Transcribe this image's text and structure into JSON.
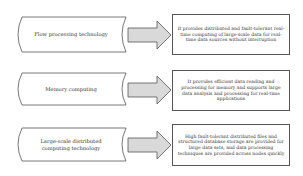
{
  "diagram": {
    "rows": [
      {
        "technology": "Flow processing technology",
        "description": "It provides distributed and fault-tolerant real-time computing of large-scale data for real-time data sources without interruption"
      },
      {
        "technology": "Memory computing",
        "description": "It provides efficient data reading and processing for memory and supports large data analysis and processing for real-time applications"
      },
      {
        "technology": "Large-scale distributed computing technology",
        "description": "High fault-tolerant distributed files and structured database storage are provided for large data sets, and data processing techniques are provided across nodes quickly"
      }
    ],
    "colors": {
      "outline": "#555555",
      "arrow_fill": "#d9d9d9",
      "background": "#ffffff"
    }
  }
}
